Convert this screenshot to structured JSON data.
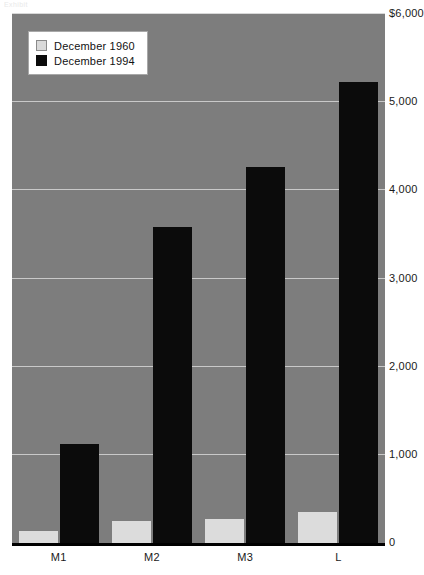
{
  "caption_strip": "Exhibit",
  "chart_data": {
    "type": "bar",
    "title": "",
    "subtitle": "",
    "xlabel": "",
    "ylabel": "",
    "categories": [
      "M1",
      "M2",
      "M3",
      "L"
    ],
    "series": [
      {
        "name": "December 1960",
        "color": "#dcdcdc",
        "values": [
          140,
          250,
          270,
          350
        ]
      },
      {
        "name": "December 1994",
        "color": "#0b0b0b",
        "values": [
          1125,
          3580,
          4260,
          5230
        ]
      }
    ],
    "ylim": [
      0,
      6000
    ],
    "yticks": [
      0,
      1000,
      2000,
      3000,
      4000,
      5000,
      6000
    ],
    "ytick_labels": [
      "0",
      "1,000",
      "2,000",
      "3,000",
      "4,000",
      "5,000",
      "$6,000"
    ],
    "grid": true,
    "grid_axis": "y",
    "legend_position": "top-left",
    "plot_background": "#7d7d7d",
    "gridline_color": "#c9c9c9",
    "axis_color": "#000000"
  },
  "legend": {
    "items": [
      {
        "label": "December 1960",
        "swatch": "light-gray"
      },
      {
        "label": "December 1994",
        "swatch": "black"
      }
    ]
  }
}
